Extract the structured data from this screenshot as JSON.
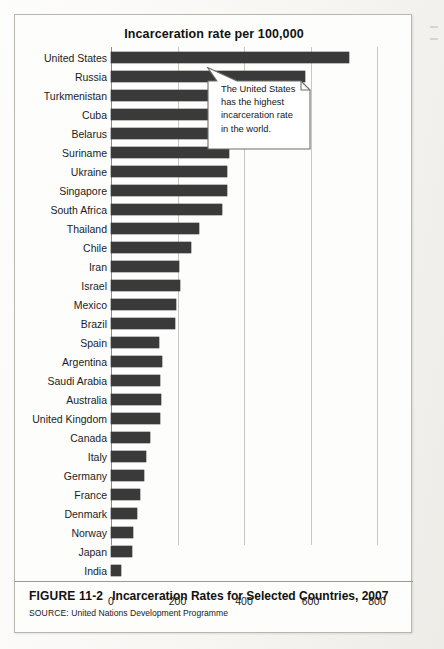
{
  "figure": {
    "number": "FIGURE 11-2",
    "caption": "Incarceration Rates for Selected Countries, 2007",
    "source_prefix": "SOURCE:",
    "source_text": "United Nations Development Programme"
  },
  "callout": {
    "text": "The United States has the highest incarceration rate in the world."
  },
  "chart_data": {
    "type": "bar",
    "orientation": "horizontal",
    "title": "Incarceration rate per 100,000",
    "xlabel": "",
    "ylabel": "",
    "xlim": [
      0,
      880
    ],
    "xticks": [
      0,
      200,
      400,
      600,
      800
    ],
    "xtick_labels": [
      "0",
      "200",
      "400",
      "600",
      "800"
    ],
    "grid": true,
    "grid_axis": "x",
    "legend": false,
    "bar_color": "#3a3a3a",
    "categories": [
      "United States",
      "Russia",
      "Turkmenistan",
      "Cuba",
      "Belarus",
      "Suriname",
      "Ukraine",
      "Singapore",
      "South Africa",
      "Thailand",
      "Chile",
      "Iran",
      "Israel",
      "Mexico",
      "Brazil",
      "Spain",
      "Argentina",
      "Saudi Arabia",
      "Australia",
      "United Kingdom",
      "Canada",
      "Italy",
      "Germany",
      "France",
      "Denmark",
      "Norway",
      "Japan",
      "India"
    ],
    "values": [
      715,
      584,
      489,
      487,
      426,
      356,
      350,
      350,
      335,
      264,
      240,
      206,
      209,
      196,
      193,
      145,
      154,
      148,
      150,
      148,
      116,
      104,
      98,
      88,
      77,
      66,
      62,
      30
    ],
    "annotations": [
      {
        "text": "The United States has the highest incarceration rate in the world.",
        "target_category": "United States"
      }
    ]
  }
}
